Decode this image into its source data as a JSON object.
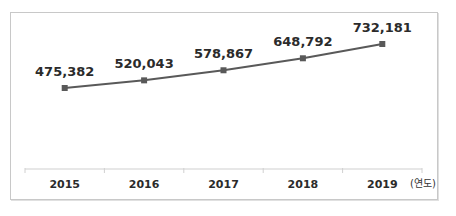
{
  "chart_data": {
    "type": "line",
    "title": "",
    "xlabel": "",
    "ylabel": "",
    "x_unit_label": "(연도)",
    "categories": [
      "2015",
      "2016",
      "2017",
      "2018",
      "2019"
    ],
    "series": [
      {
        "name": "",
        "values": [
          475382,
          520043,
          578867,
          648792,
          732181
        ],
        "value_labels": [
          "475,382",
          "520,043",
          "578,867",
          "648,792",
          "732,181"
        ],
        "color": "#595959",
        "marker": "square"
      }
    ],
    "grid": false,
    "legend": "none",
    "y_axis_visible": false
  },
  "colors": {
    "line": "#595959",
    "marker": "#595959",
    "axis": "#d0d0d0",
    "frame": "#c8c8c8",
    "text": "#2b2b2b"
  }
}
